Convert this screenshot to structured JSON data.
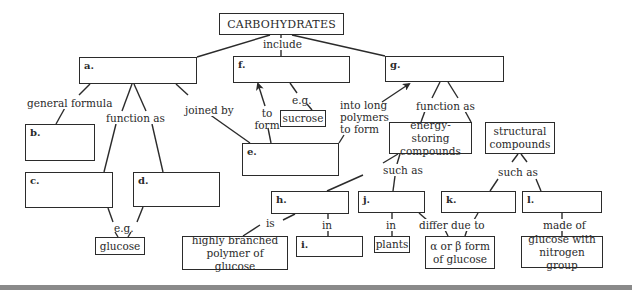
{
  "diagram": {
    "title": "CARBOHYDRATES",
    "blanks": {
      "a": "a.",
      "b": "b.",
      "c": "c.",
      "d": "d.",
      "e": "e.",
      "f": "f.",
      "g": "g.",
      "h": "h.",
      "i": "i.",
      "j": "j.",
      "k": "k.",
      "l": "l."
    },
    "concepts": {
      "sucrose": "sucrose",
      "glucose": "glucose",
      "energy_storing": "energy-storing compounds",
      "structural": "structural compounds",
      "highly_branched": "highly branched polymer of glucose",
      "plants": "plants",
      "alpha_beta": "α or β form of glucose",
      "glucose_nitrogen": "glucose with nitrogen group"
    },
    "links": {
      "include": "include",
      "general_formula": "general formula",
      "function_as_a": "function as",
      "joined_by": "joined by",
      "to_form": "to form",
      "eg_sucrose": "e.g.",
      "into_long_polymers": "into long polymers to form",
      "function_as_g": "function as",
      "eg_glucose": "e.g.",
      "such_as_energy": "such as",
      "such_as_structural": "such as",
      "is": "is",
      "in_h": "in",
      "in_j": "in",
      "differ_due_to": "differ due to",
      "made_of": "made of"
    }
  }
}
